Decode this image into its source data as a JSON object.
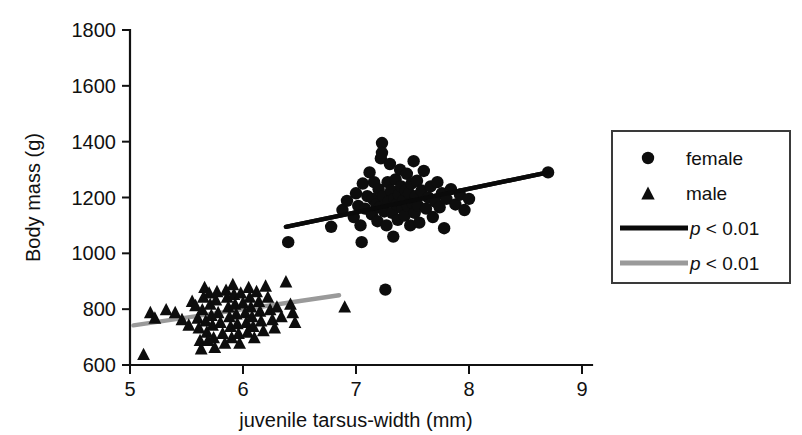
{
  "chart_data": {
    "type": "scatter",
    "title": "",
    "xlabel": "juvenile tarsus-width (mm)",
    "ylabel": "Body mass (g)",
    "xlim": [
      5,
      9
    ],
    "ylim": [
      600,
      1800
    ],
    "xticks": [
      5,
      6,
      7,
      8,
      9
    ],
    "yticks": [
      600,
      800,
      1000,
      1200,
      1400,
      1600,
      1800
    ],
    "xtick_labels": [
      "5",
      "6",
      "7",
      "8",
      "9"
    ],
    "ytick_labels": [
      "600",
      "800",
      "1000",
      "1200",
      "1400",
      "1600",
      "1800"
    ],
    "grid": false,
    "legend_position": "right-outside",
    "series": [
      {
        "name": "female",
        "marker": "circle",
        "color": "#0d0d0d",
        "points": [
          [
            6.4,
            1040
          ],
          [
            6.78,
            1095
          ],
          [
            6.88,
            1155
          ],
          [
            6.92,
            1188
          ],
          [
            6.98,
            1130
          ],
          [
            7.0,
            1215
          ],
          [
            7.02,
            1170
          ],
          [
            7.04,
            1100
          ],
          [
            7.05,
            1040
          ],
          [
            7.06,
            1250
          ],
          [
            7.08,
            1160
          ],
          [
            7.1,
            1205
          ],
          [
            7.12,
            1290
          ],
          [
            7.14,
            1140
          ],
          [
            7.15,
            1195
          ],
          [
            7.16,
            1255
          ],
          [
            7.18,
            1175
          ],
          [
            7.19,
            1115
          ],
          [
            7.2,
            1230
          ],
          [
            7.21,
            1165
          ],
          [
            7.22,
            1340
          ],
          [
            7.23,
            1395
          ],
          [
            7.23,
            1360
          ],
          [
            7.24,
            1205
          ],
          [
            7.25,
            1150
          ],
          [
            7.26,
            870
          ],
          [
            7.27,
            1100
          ],
          [
            7.28,
            1255
          ],
          [
            7.29,
            1185
          ],
          [
            7.3,
            1320
          ],
          [
            7.31,
            1225
          ],
          [
            7.32,
            1145
          ],
          [
            7.33,
            1060
          ],
          [
            7.34,
            1195
          ],
          [
            7.35,
            1265
          ],
          [
            7.36,
            1175
          ],
          [
            7.37,
            1120
          ],
          [
            7.38,
            1210
          ],
          [
            7.39,
            1300
          ],
          [
            7.4,
            1240
          ],
          [
            7.41,
            1160
          ],
          [
            7.42,
            1190
          ],
          [
            7.43,
            1135
          ],
          [
            7.44,
            1225
          ],
          [
            7.45,
            1285
          ],
          [
            7.46,
            1170
          ],
          [
            7.47,
            1215
          ],
          [
            7.48,
            1100
          ],
          [
            7.49,
            1250
          ],
          [
            7.5,
            1180
          ],
          [
            7.51,
            1330
          ],
          [
            7.52,
            1145
          ],
          [
            7.53,
            1205
          ],
          [
            7.54,
            1260
          ],
          [
            7.55,
            1170
          ],
          [
            7.56,
            1110
          ],
          [
            7.58,
            1225
          ],
          [
            7.6,
            1295
          ],
          [
            7.62,
            1160
          ],
          [
            7.64,
            1200
          ],
          [
            7.66,
            1240
          ],
          [
            7.68,
            1130
          ],
          [
            7.7,
            1185
          ],
          [
            7.72,
            1255
          ],
          [
            7.74,
            1165
          ],
          [
            7.76,
            1215
          ],
          [
            7.78,
            1090
          ],
          [
            7.8,
            1195
          ],
          [
            7.84,
            1230
          ],
          [
            7.88,
            1175
          ],
          [
            7.92,
            1210
          ],
          [
            7.96,
            1155
          ],
          [
            8.0,
            1195
          ],
          [
            8.7,
            1290
          ]
        ]
      },
      {
        "name": "male",
        "marker": "triangle",
        "color": "#0d0d0d",
        "points": [
          [
            5.12,
            640
          ],
          [
            5.18,
            790
          ],
          [
            5.22,
            770
          ],
          [
            5.32,
            800
          ],
          [
            5.4,
            790
          ],
          [
            5.46,
            765
          ],
          [
            5.52,
            745
          ],
          [
            5.55,
            830
          ],
          [
            5.58,
            815
          ],
          [
            5.6,
            770
          ],
          [
            5.61,
            735
          ],
          [
            5.62,
            690
          ],
          [
            5.63,
            660
          ],
          [
            5.64,
            800
          ],
          [
            5.65,
            845
          ],
          [
            5.66,
            880
          ],
          [
            5.67,
            760
          ],
          [
            5.68,
            720
          ],
          [
            5.69,
            690
          ],
          [
            5.7,
            860
          ],
          [
            5.71,
            820
          ],
          [
            5.72,
            780
          ],
          [
            5.73,
            745
          ],
          [
            5.74,
            700
          ],
          [
            5.75,
            665
          ],
          [
            5.76,
            835
          ],
          [
            5.77,
            865
          ],
          [
            5.78,
            790
          ],
          [
            5.8,
            755
          ],
          [
            5.82,
            715
          ],
          [
            5.84,
            680
          ],
          [
            5.85,
            870
          ],
          [
            5.86,
            845
          ],
          [
            5.87,
            810
          ],
          [
            5.88,
            775
          ],
          [
            5.89,
            740
          ],
          [
            5.9,
            700
          ],
          [
            5.91,
            890
          ],
          [
            5.92,
            855
          ],
          [
            5.93,
            820
          ],
          [
            5.94,
            785
          ],
          [
            5.95,
            750
          ],
          [
            5.96,
            715
          ],
          [
            5.97,
            680
          ],
          [
            5.98,
            860
          ],
          [
            6.0,
            825
          ],
          [
            6.02,
            790
          ],
          [
            6.03,
            755
          ],
          [
            6.04,
            720
          ],
          [
            6.05,
            880
          ],
          [
            6.06,
            845
          ],
          [
            6.07,
            810
          ],
          [
            6.08,
            775
          ],
          [
            6.09,
            740
          ],
          [
            6.1,
            700
          ],
          [
            6.12,
            865
          ],
          [
            6.14,
            830
          ],
          [
            6.15,
            795
          ],
          [
            6.16,
            760
          ],
          [
            6.18,
            725
          ],
          [
            6.2,
            885
          ],
          [
            6.22,
            845
          ],
          [
            6.24,
            800
          ],
          [
            6.26,
            765
          ],
          [
            6.28,
            735
          ],
          [
            6.3,
            810
          ],
          [
            6.34,
            775
          ],
          [
            6.38,
            900
          ],
          [
            6.42,
            820
          ],
          [
            6.44,
            790
          ],
          [
            6.46,
            755
          ],
          [
            6.9,
            810
          ]
        ]
      }
    ],
    "fit_lines": [
      {
        "name": "female-fit",
        "color": "#0a0a0a",
        "style": "solid",
        "label": "p < 0.01",
        "x_start": 6.38,
        "y_start": 1095,
        "x_end": 8.7,
        "y_end": 1290
      },
      {
        "name": "male-fit",
        "color": "#9a9a9a",
        "style": "solid",
        "label": "p < 0.01",
        "x_start": 5.03,
        "y_start": 742,
        "x_end": 6.85,
        "y_end": 850
      }
    ],
    "legend": {
      "entries": [
        {
          "label": "female",
          "marker": "circle",
          "color": "#0d0d0d"
        },
        {
          "label": "male",
          "marker": "triangle",
          "color": "#0d0d0d"
        },
        {
          "label_italic": "p",
          "label_rest": " < 0.01",
          "marker": "line",
          "color": "#0a0a0a"
        },
        {
          "label_italic": "p",
          "label_rest": " < 0.01",
          "marker": "line",
          "color": "#9a9a9a"
        }
      ]
    }
  }
}
